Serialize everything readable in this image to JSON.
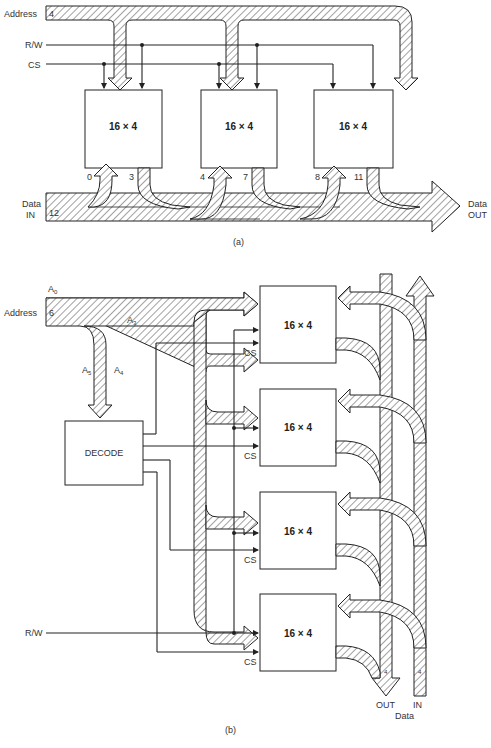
{
  "figure_a": {
    "caption": "(a)",
    "address_label": "Address",
    "address_width": "4",
    "rw_label": "R/W",
    "cs_label": "CS",
    "chips": [
      {
        "label": "16 × 4",
        "in_bit": "0",
        "out_bit": "3"
      },
      {
        "label": "16 × 4",
        "in_bit": "4",
        "out_bit": "7"
      },
      {
        "label": "16 × 4",
        "in_bit": "8",
        "out_bit": "11"
      }
    ],
    "data_in_label_1": "Data",
    "data_in_label_2": "IN",
    "data_in_width": "12",
    "data_out_label_1": "Data",
    "data_out_label_2": "OUT"
  },
  "figure_b": {
    "caption": "(b)",
    "a0_label": "A",
    "a0_sub": "0",
    "address_label": "Address",
    "address_width": "6",
    "a3_label": "A",
    "a3_sub": "3",
    "a5_label": "A",
    "a5_sub": "5",
    "a4_label": "A",
    "a4_sub": "4",
    "decode_label": "DECODE",
    "rw_label": "R/W",
    "chips": [
      {
        "label": "16 × 4",
        "cs_label": "CS"
      },
      {
        "label": "16 × 4",
        "cs_label": "CS"
      },
      {
        "label": "16 × 4",
        "cs_label": "CS"
      },
      {
        "label": "16 × 4",
        "cs_label": "CS"
      }
    ],
    "out_width": "4",
    "in_width": "4",
    "out_label": "OUT",
    "in_label": "IN",
    "data_label": "Data"
  }
}
